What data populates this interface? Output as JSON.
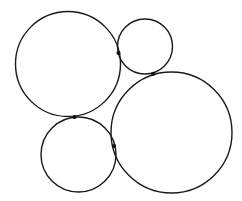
{
  "canvas": {
    "width": 242,
    "height": 201,
    "background": "#ffffff"
  },
  "style": {
    "stroke_color": "#1a1a1a",
    "stroke_width": 1.4,
    "point_color": "#111111",
    "point_radius": 2.1
  },
  "circles": [
    {
      "id": "top-left-circle",
      "cx": 68,
      "cy": 64,
      "r": 52.5
    },
    {
      "id": "top-right-circle",
      "cx": 145,
      "cy": 46.5,
      "r": 27.5
    },
    {
      "id": "bottom-right-circle",
      "cx": 171.5,
      "cy": 132.5,
      "r": 60.5
    },
    {
      "id": "bottom-left-circle",
      "cx": 78.5,
      "cy": 154.5,
      "r": 37.5
    }
  ],
  "tangent_points": [
    {
      "id": "tangent-point-top-left-top-right",
      "x": 118.5,
      "y": 53
    },
    {
      "id": "tangent-point-top-right-bottom-right",
      "x": 153,
      "y": 74
    },
    {
      "id": "tangent-point-top-left-bottom-left",
      "x": 74.5,
      "y": 117
    },
    {
      "id": "tangent-point-bottom-left-bottom-right",
      "x": 114,
      "y": 146
    }
  ]
}
